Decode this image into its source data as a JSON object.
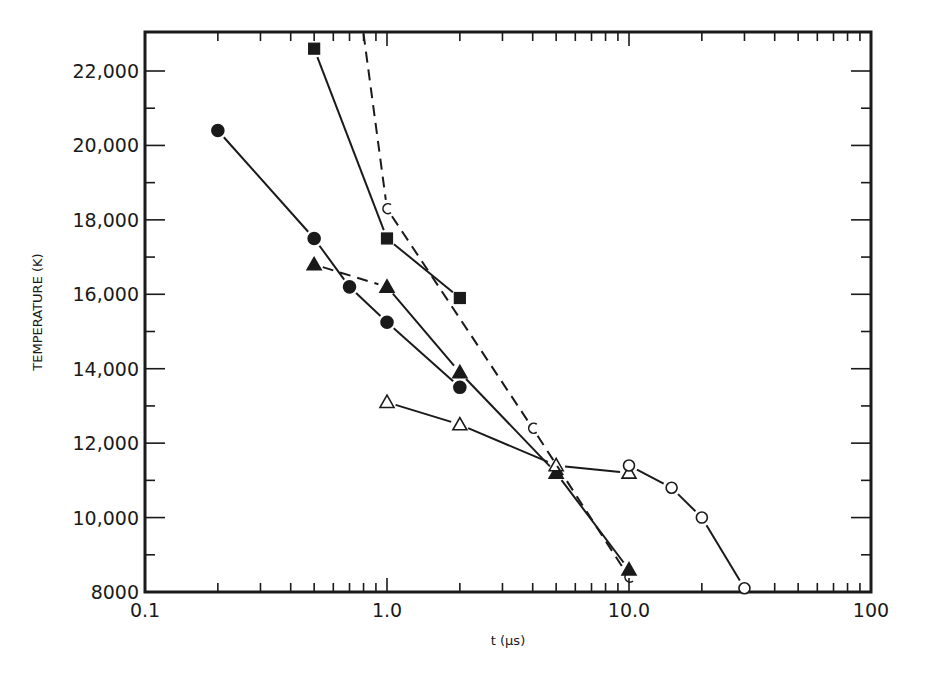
{
  "chart_data": {
    "type": "line",
    "title": "",
    "xlabel": "t (μs)",
    "ylabel": "TEMPERATURE (K)",
    "xscale": "log",
    "xlim": [
      0.1,
      100
    ],
    "ylim": [
      8000,
      23000
    ],
    "x_tick_labels": [
      "0.1",
      "1.0",
      "10.0",
      "100"
    ],
    "x_tick_values": [
      0.1,
      1.0,
      10.0,
      100
    ],
    "y_tick_labels": [
      "8000",
      "10,000",
      "12,000",
      "14,000",
      "16,000",
      "18,000",
      "20,000",
      "22,000"
    ],
    "y_tick_values": [
      8000,
      10000,
      12000,
      14000,
      16000,
      18000,
      20000,
      22000
    ],
    "grid": false,
    "legend": null,
    "series": [
      {
        "name": "filled-circles",
        "marker": "circle-filled",
        "line": "solid",
        "x": [
          0.2,
          0.5,
          0.7,
          1.0,
          2.0
        ],
        "y": [
          20400,
          17500,
          16200,
          15250,
          13500
        ]
      },
      {
        "name": "filled-squares",
        "marker": "square-filled",
        "line": "solid",
        "x": [
          0.5,
          1.0,
          2.0
        ],
        "y": [
          22600,
          17500,
          15900
        ]
      },
      {
        "name": "filled-triangles",
        "marker": "triangle-filled",
        "line": "solid (first segment dashed)",
        "x": [
          0.5,
          1.0,
          2.0,
          5.0,
          10.0
        ],
        "y": [
          16800,
          16200,
          13900,
          11200,
          8600
        ]
      },
      {
        "name": "open-triangles",
        "marker": "triangle-open",
        "line": "solid",
        "x": [
          1.0,
          2.0,
          5.0,
          10.0
        ],
        "y": [
          13100,
          12500,
          11400,
          11200
        ]
      },
      {
        "name": "open-circles-dashed",
        "marker": "circle-open",
        "line": "dashed",
        "x": [
          0.8,
          1.0,
          4.0,
          10.0
        ],
        "y": [
          23000,
          18300,
          12400,
          8400
        ]
      },
      {
        "name": "open-circles-solid",
        "marker": "circle-open",
        "line": "solid",
        "x": [
          10.0,
          15.0,
          20.0,
          30.0
        ],
        "y": [
          11400,
          10800,
          10000,
          8100
        ]
      }
    ]
  },
  "colors": {
    "ink": "#1a1a1a",
    "background": "#ffffff"
  },
  "frame": {
    "left": 145,
    "right": 871,
    "top": 32,
    "bottom": 592
  }
}
